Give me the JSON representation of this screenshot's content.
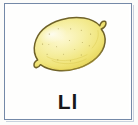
{
  "card": {
    "type": "alphabet-flashcard",
    "letter_label": "Ll",
    "letter_uppercase": "L",
    "letter_lowercase": "l",
    "illustration_name": "lemon",
    "illustration_style": "hand-drawn watercolor",
    "alt_text": "A hand-drawn yellow lemon"
  },
  "colors": {
    "frame_border": "#7489a8",
    "frame_shadow": "#c9d2de",
    "card_background": "#fefefd",
    "page_background": "#fcfcfa",
    "label_text": "#17171a",
    "lemon_body": "#f2e77f",
    "lemon_body_light": "#f8f1ad",
    "lemon_highlight": "#fdf8d2",
    "lemon_mid": "#ecdc5e",
    "lemon_shadow": "#ddc63f",
    "lemon_outline": "#6f6229",
    "lemon_speck": "#8a7a30"
  },
  "geometry": {
    "width_px": 138,
    "height_px": 125,
    "frame_left_px": 4,
    "frame_top_px": 3,
    "frame_width_px": 128,
    "frame_height_px": 117
  }
}
